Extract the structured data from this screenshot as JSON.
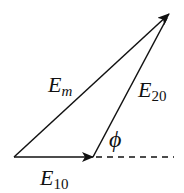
{
  "diagram": {
    "colors": {
      "stroke": "#111111",
      "background": "#ffffff"
    },
    "points": {
      "origin": [
        14,
        157
      ],
      "e10_tip": [
        93,
        157
      ],
      "em_tip": [
        169,
        14
      ],
      "dash_end": [
        174,
        157
      ]
    },
    "vectors": [
      {
        "name": "E10",
        "from": "origin",
        "to": "e10_tip"
      },
      {
        "name": "E20",
        "from": "e10_tip",
        "to": "em_tip"
      },
      {
        "name": "Em",
        "from": "origin",
        "to": "em_tip"
      }
    ],
    "labels": {
      "em": {
        "main": "E",
        "sub": "m"
      },
      "e20": {
        "main": "E",
        "sub": "20"
      },
      "e10": {
        "main": "E",
        "sub": "10"
      },
      "phi": "ϕ"
    }
  }
}
